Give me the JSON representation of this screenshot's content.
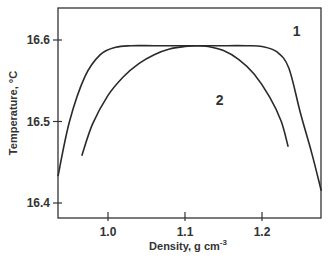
{
  "chart_data": {
    "type": "line",
    "title": "",
    "xlabel": "Density, g cm-3",
    "xlabel_main": "Density, g cm",
    "xlabel_sup": "-3",
    "ylabel": "Temperature, °C",
    "xlim": [
      0.935,
      1.277
    ],
    "ylim": [
      16.382,
      16.641
    ],
    "xticks": [
      1.0,
      1.1,
      1.2
    ],
    "xtick_labels": [
      "1.0",
      "1.1",
      "1.2"
    ],
    "yticks": [
      16.4,
      16.5,
      16.6
    ],
    "ytick_labels": [
      "16.4",
      "16.5",
      "16.6"
    ],
    "grid": false,
    "legend": "inline curve labels",
    "series": [
      {
        "name": "1",
        "x": [
          0.935,
          0.95,
          0.97,
          0.99,
          1.01,
          1.03,
          1.06,
          1.1,
          1.14,
          1.18,
          1.2,
          1.22,
          1.235,
          1.25,
          1.265,
          1.277
        ],
        "y": [
          16.433,
          16.5,
          16.555,
          16.582,
          16.591,
          16.593,
          16.593,
          16.593,
          16.593,
          16.593,
          16.592,
          16.585,
          16.565,
          16.51,
          16.46,
          16.415
        ]
      },
      {
        "name": "2",
        "x": [
          0.966,
          0.98,
          1.0,
          1.02,
          1.04,
          1.06,
          1.08,
          1.1,
          1.115,
          1.13,
          1.15,
          1.17,
          1.19,
          1.21,
          1.225,
          1.234
        ],
        "y": [
          16.458,
          16.497,
          16.532,
          16.555,
          16.571,
          16.582,
          16.589,
          16.592,
          16.593,
          16.592,
          16.587,
          16.576,
          16.558,
          16.53,
          16.5,
          16.469
        ]
      }
    ],
    "annotations": [
      {
        "text": "1",
        "x": 1.245,
        "y": 16.605
      },
      {
        "text": "2",
        "x": 1.145,
        "y": 16.52
      }
    ]
  }
}
